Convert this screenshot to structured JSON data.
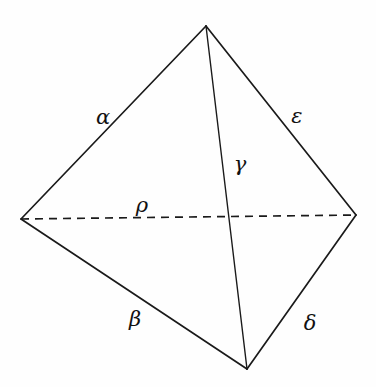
{
  "diagram": {
    "type": "tetrahedron",
    "vertices": {
      "top": [
        206,
        26
      ],
      "left": [
        21,
        219
      ],
      "right": [
        356,
        215
      ],
      "bottom": [
        247,
        369
      ]
    },
    "edges": [
      {
        "id": "alpha",
        "label": "α",
        "from": "top",
        "to": "left",
        "style": "solid"
      },
      {
        "id": "epsilon",
        "label": "ε",
        "from": "top",
        "to": "right",
        "style": "solid"
      },
      {
        "id": "gamma",
        "label": "γ",
        "from": "top",
        "to": "bottom",
        "style": "solid"
      },
      {
        "id": "rho",
        "label": "ρ",
        "from": "left",
        "to": "right",
        "style": "dashed"
      },
      {
        "id": "beta",
        "label": "β",
        "from": "left",
        "to": "bottom",
        "style": "solid"
      },
      {
        "id": "delta",
        "label": "δ",
        "from": "right",
        "to": "bottom",
        "style": "solid"
      }
    ],
    "labels": {
      "alpha": "α",
      "epsilon": "ε",
      "gamma": "γ",
      "rho": "ρ",
      "beta": "β",
      "delta": "δ"
    },
    "colors": {
      "line": "#1a1a1a",
      "background": "#fefefe"
    }
  }
}
